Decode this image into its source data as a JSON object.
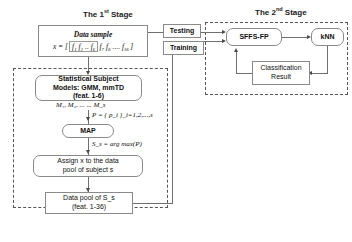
{
  "diagram": {
    "stage1": {
      "title_prefix": "The 1",
      "title_sup": "st",
      "title_suffix": " Stage"
    },
    "stage2": {
      "title_prefix": "The 2",
      "title_sup": "nd",
      "title_suffix": " Stage"
    },
    "data_sample": {
      "label": "Data sample",
      "formula_lhs": "x = [",
      "formula_group1": "f₁ f₂ .. f₆",
      "formula_group2": "f₇ f₈ .... f₃₆",
      "formula_rhs": "]"
    },
    "stat_models": {
      "line1": "Statistical Subject",
      "line2": "Models: GMM, mmTD",
      "line3": "(feat. 1-6)"
    },
    "models_list": "M₁, M₂, ... ... M_s",
    "prob_label": "P = { p_i }_i=1,2,...,s",
    "map": {
      "label": "MAP"
    },
    "argmax_label": "S_s = arg max(P)",
    "assign": {
      "line1": "Assign x to the data",
      "line2": "pool of subject s"
    },
    "data_pool": {
      "line1": "Data pool of S_s",
      "line2": "(feat. 1-36)"
    },
    "edges": {
      "testing": "Testing",
      "training": "Training"
    },
    "sffs": {
      "label": "SFFS-FP"
    },
    "knn": {
      "label": "kNN"
    },
    "classification": {
      "line1": "Classification",
      "line2": "Result"
    },
    "colors": {
      "stroke": "#6f6f6f",
      "box_border": "#8a8a8a",
      "dashed": "#555555",
      "text": "#111111",
      "background": "#ffffff"
    }
  }
}
